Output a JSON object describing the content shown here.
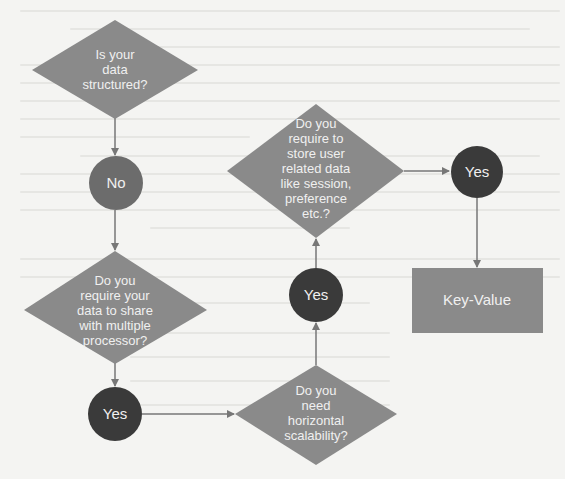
{
  "diagram": {
    "type": "flowchart",
    "colors": {
      "background": "#f4f4f2",
      "decision_fill": "#8a8a8a",
      "answer_dark": "#3a3a3a",
      "answer_no": "#6c6c6c",
      "result_fill": "#8a8a8a",
      "arrow": "#777777",
      "text": "#f0f0f0"
    },
    "nodes": {
      "q1": {
        "shape": "diamond",
        "lines": [
          "Is your",
          "data",
          "structured?"
        ]
      },
      "a_no": {
        "shape": "circle",
        "label": "No"
      },
      "q2": {
        "shape": "diamond",
        "lines": [
          "Do you",
          "require your",
          "data to share",
          "with multiple",
          "processor?"
        ]
      },
      "a_yes1": {
        "shape": "circle",
        "label": "Yes"
      },
      "q3": {
        "shape": "diamond",
        "lines": [
          "Do you",
          "need",
          "horizontal",
          "scalability?"
        ]
      },
      "a_yes2": {
        "shape": "circle",
        "label": "Yes"
      },
      "q4": {
        "shape": "diamond",
        "lines": [
          "Do you",
          "require to",
          "store user",
          "related data",
          "like session,",
          "preference",
          "etc.?"
        ]
      },
      "a_yes3": {
        "shape": "circle",
        "label": "Yes"
      },
      "result": {
        "shape": "rectangle",
        "label": "Key-Value"
      }
    },
    "edges": [
      {
        "from": "q1",
        "to": "a_no"
      },
      {
        "from": "a_no",
        "to": "q2"
      },
      {
        "from": "q2",
        "to": "a_yes1"
      },
      {
        "from": "a_yes1",
        "to": "q3"
      },
      {
        "from": "q3",
        "to": "a_yes2"
      },
      {
        "from": "a_yes2",
        "to": "q4"
      },
      {
        "from": "q4",
        "to": "a_yes3"
      },
      {
        "from": "a_yes3",
        "to": "result"
      }
    ]
  }
}
